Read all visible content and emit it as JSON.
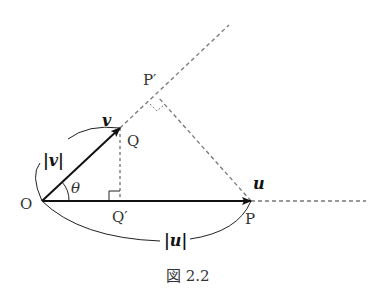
{
  "figure": {
    "caption": "図 2.2",
    "labels": {
      "O": "O",
      "P": "P",
      "Q": "Q",
      "P_prime": "P′",
      "Q_prime": "Q′",
      "theta": "θ",
      "vec_u": "u",
      "vec_v": "v",
      "abs_u": "|u|",
      "abs_v": "|v|"
    },
    "points": {
      "O": [
        42,
        201
      ],
      "P": [
        251,
        201
      ],
      "Q": [
        120,
        128
      ],
      "P_prime": [
        158,
        97
      ],
      "Q_prime": [
        120,
        201
      ]
    },
    "colors": {
      "line": "#111111",
      "dashed": "#777777",
      "text": "#333333"
    }
  }
}
